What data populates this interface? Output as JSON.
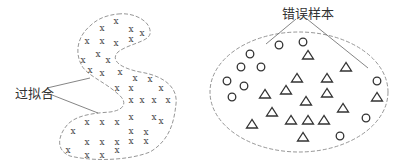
{
  "labels": {
    "overfit": "过拟合",
    "error_samples": "错误样本"
  },
  "colors": {
    "stroke": "#7a7a7a",
    "marker": "#333333",
    "text": "#333333"
  },
  "left_panel": {
    "title": "过拟合",
    "marker": "x",
    "points": [
      [
        116,
        21
      ],
      [
        102,
        28
      ],
      [
        131,
        29
      ],
      [
        142,
        33
      ],
      [
        87,
        41
      ],
      [
        102,
        41
      ],
      [
        116,
        43
      ],
      [
        131,
        39
      ],
      [
        83,
        60
      ],
      [
        98,
        54
      ],
      [
        108,
        60
      ],
      [
        90,
        70
      ],
      [
        102,
        73
      ],
      [
        120,
        72
      ],
      [
        135,
        78
      ],
      [
        150,
        79
      ],
      [
        117,
        88
      ],
      [
        131,
        88
      ],
      [
        161,
        88
      ],
      [
        131,
        100
      ],
      [
        142,
        100
      ],
      [
        154,
        100
      ],
      [
        168,
        100
      ],
      [
        131,
        117
      ],
      [
        154,
        117
      ],
      [
        161,
        121
      ],
      [
        87,
        122
      ],
      [
        102,
        122
      ],
      [
        117,
        122
      ],
      [
        73,
        131
      ],
      [
        131,
        131
      ],
      [
        146,
        132
      ],
      [
        87,
        142
      ],
      [
        102,
        142
      ],
      [
        117,
        142
      ],
      [
        131,
        141
      ],
      [
        146,
        141
      ],
      [
        68,
        150
      ],
      [
        117,
        150
      ],
      [
        87,
        155
      ],
      [
        102,
        155
      ]
    ]
  },
  "right_panel": {
    "title": "错误样本",
    "circles": [
      [
        279,
        45
      ],
      [
        303,
        42
      ],
      [
        250,
        54
      ],
      [
        241,
        67
      ],
      [
        261,
        67
      ],
      [
        227,
        81
      ],
      [
        244,
        86
      ],
      [
        232,
        97
      ],
      [
        377,
        81
      ],
      [
        366,
        118
      ],
      [
        340,
        136
      ]
    ],
    "triangles": [
      [
        308,
        55
      ],
      [
        346,
        67
      ],
      [
        297,
        78
      ],
      [
        327,
        78
      ],
      [
        286,
        90
      ],
      [
        327,
        93
      ],
      [
        265,
        94
      ],
      [
        306,
        101
      ],
      [
        377,
        97
      ],
      [
        272,
        112
      ],
      [
        343,
        108
      ],
      [
        291,
        120
      ],
      [
        308,
        120
      ],
      [
        324,
        120
      ],
      [
        252,
        124
      ],
      [
        303,
        137
      ]
    ]
  }
}
